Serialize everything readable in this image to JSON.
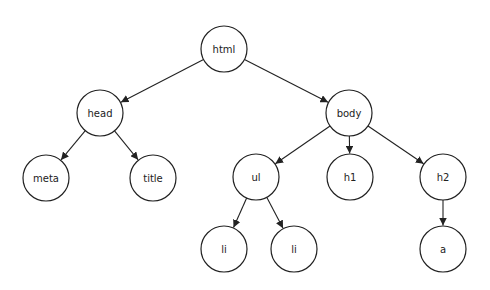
{
  "diagram": {
    "type": "tree",
    "nodes": [
      {
        "id": "html",
        "label": "html",
        "x": 224,
        "y": 49
      },
      {
        "id": "head",
        "label": "head",
        "x": 100,
        "y": 113
      },
      {
        "id": "body",
        "label": "body",
        "x": 349,
        "y": 113
      },
      {
        "id": "meta",
        "label": "meta",
        "x": 46,
        "y": 178
      },
      {
        "id": "title",
        "label": "title",
        "x": 153,
        "y": 178
      },
      {
        "id": "ul",
        "label": "ul",
        "x": 256,
        "y": 177
      },
      {
        "id": "h1",
        "label": "h1",
        "x": 350,
        "y": 177
      },
      {
        "id": "h2",
        "label": "h2",
        "x": 443,
        "y": 177
      },
      {
        "id": "li1",
        "label": "li",
        "x": 224,
        "y": 249
      },
      {
        "id": "li2",
        "label": "li",
        "x": 294,
        "y": 249
      },
      {
        "id": "a",
        "label": "a",
        "x": 443,
        "y": 249
      }
    ],
    "edges": [
      {
        "from": "html",
        "to": "head"
      },
      {
        "from": "html",
        "to": "body"
      },
      {
        "from": "head",
        "to": "meta"
      },
      {
        "from": "head",
        "to": "title"
      },
      {
        "from": "body",
        "to": "ul"
      },
      {
        "from": "body",
        "to": "h1"
      },
      {
        "from": "body",
        "to": "h2"
      },
      {
        "from": "ul",
        "to": "li1"
      },
      {
        "from": "ul",
        "to": "li2"
      },
      {
        "from": "h2",
        "to": "a"
      }
    ],
    "node_radius": 23
  }
}
